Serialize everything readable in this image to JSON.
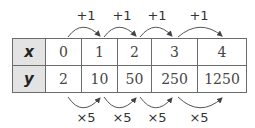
{
  "table": {
    "rows": [
      {
        "header": "x",
        "values": [
          "0",
          "1",
          "2",
          "3",
          "4"
        ]
      },
      {
        "header": "y",
        "values": [
          "2",
          "10",
          "50",
          "250",
          "1250"
        ]
      }
    ]
  },
  "top_annotations": [
    "+1",
    "+1",
    "+1",
    "+1"
  ],
  "bottom_annotations": [
    "×5",
    "×5",
    "×5",
    "×5"
  ],
  "colors": {
    "header_bg": "#e3e3e3",
    "border": "#6b6b6b",
    "arrow": "#444444"
  }
}
